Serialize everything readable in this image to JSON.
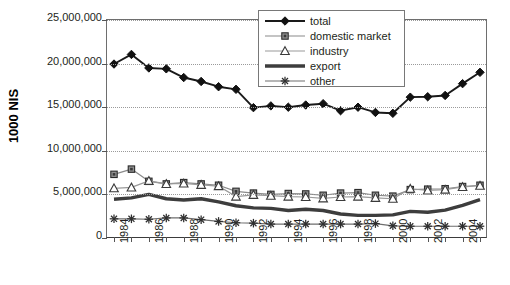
{
  "chart_data": {
    "type": "line",
    "title": "",
    "xlabel": "",
    "ylabel": "1000 NIS",
    "xlim": [
      1984,
      2005
    ],
    "ylim": [
      0,
      25000000
    ],
    "grid": true,
    "legend_position": "top-right",
    "x": [
      1984,
      1985,
      1986,
      1987,
      1988,
      1989,
      1990,
      1991,
      1992,
      1993,
      1994,
      1995,
      1996,
      1997,
      1998,
      1999,
      2000,
      2001,
      2002,
      2003,
      2004,
      2005
    ],
    "y_ticks": [
      0,
      5000000,
      10000000,
      15000000,
      20000000,
      25000000
    ],
    "y_tick_labels": [
      "0",
      "5,000,000",
      "10,000,000",
      "15,000,000",
      "20,000,000",
      "25,000,000"
    ],
    "x_tick_labels": [
      "1984",
      "",
      "1986",
      "",
      "1988",
      "",
      "1990",
      "",
      "1992",
      "",
      "1994",
      "",
      "1996",
      "",
      "1998",
      "",
      "2000",
      "",
      "2002",
      "",
      "2004",
      ""
    ],
    "series": [
      {
        "name": "total",
        "marker": "diamond",
        "color": "#1a1a1a",
        "values": [
          19950000,
          21050000,
          19500000,
          19400000,
          18400000,
          17950000,
          17350000,
          17050000,
          14950000,
          15150000,
          15000000,
          15250000,
          15400000,
          14600000,
          15000000,
          14400000,
          14300000,
          16150000,
          16200000,
          16350000,
          17700000,
          19000000
        ]
      },
      {
        "name": "domestic market",
        "marker": "square",
        "color": "#8a8a8a",
        "values": [
          7300000,
          7900000,
          6500000,
          6200000,
          6350000,
          6200000,
          6050000,
          5350000,
          5150000,
          5000000,
          5100000,
          5050000,
          4900000,
          5150000,
          5200000,
          4900000,
          4800000,
          5550000,
          5600000,
          5650000,
          5900000,
          6050000
        ]
      },
      {
        "name": "industry",
        "marker": "triangle",
        "color": "#9a9a9a",
        "values": [
          5700000,
          5800000,
          6550000,
          6200000,
          6250000,
          6100000,
          5950000,
          4750000,
          4950000,
          4850000,
          4750000,
          4700000,
          4550000,
          4700000,
          4750000,
          4600000,
          4500000,
          5650000,
          5450000,
          5550000,
          5850000,
          6000000
        ]
      },
      {
        "name": "export",
        "marker": "none",
        "color": "#3d3d3d",
        "values": [
          4450000,
          4600000,
          5000000,
          4500000,
          4350000,
          4500000,
          4150000,
          3700000,
          3450000,
          3400000,
          3150000,
          3300000,
          3150000,
          2750000,
          2600000,
          2600000,
          2650000,
          3050000,
          2950000,
          3200000,
          3750000,
          4400000
        ]
      },
      {
        "name": "other",
        "marker": "asterisk",
        "color": "#6e6e6e",
        "values": [
          2200000,
          2200000,
          2150000,
          2300000,
          2300000,
          2100000,
          1900000,
          1750000,
          1700000,
          1600000,
          1600000,
          1600000,
          1600000,
          1600000,
          1600000,
          1650000,
          1400000,
          1350000,
          1350000,
          1350000,
          1350000,
          1350000
        ]
      }
    ]
  },
  "legend": {
    "items": [
      {
        "label": "total"
      },
      {
        "label": "domestic market"
      },
      {
        "label": "industry"
      },
      {
        "label": "export"
      },
      {
        "label": "other"
      }
    ]
  }
}
